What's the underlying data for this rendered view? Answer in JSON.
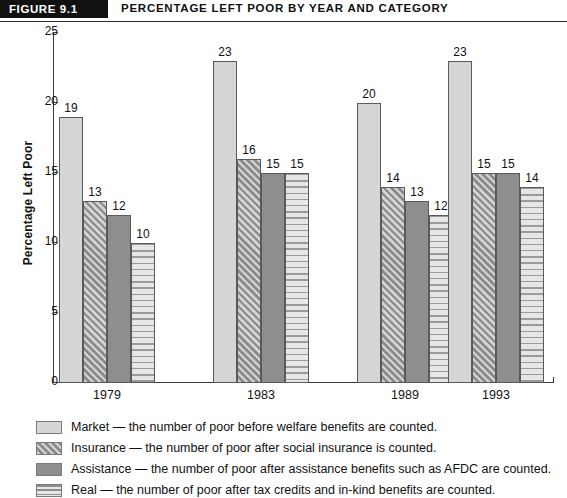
{
  "header": {
    "figure_tag": "FIGURE 9.1",
    "title": "PERCENTAGE LEFT POOR BY YEAR AND CATEGORY"
  },
  "chart_data": {
    "type": "bar",
    "title": "PERCENTAGE LEFT POOR BY YEAR AND CATEGORY",
    "xlabel": "",
    "ylabel": "Percentage Left Poor",
    "ylim": [
      0,
      25
    ],
    "yticks": [
      0,
      5,
      10,
      15,
      20,
      25
    ],
    "grid": false,
    "legend_position": "below",
    "categories": [
      "1979",
      "1983",
      "1989",
      "1993"
    ],
    "series": [
      {
        "name": "Market",
        "pattern": "solid-light-gray",
        "color": "#d6d6d6",
        "values": [
          19,
          23,
          20,
          23
        ]
      },
      {
        "name": "Insurance",
        "pattern": "diagonal-hatch",
        "color": "#d2d2d2",
        "values": [
          13,
          16,
          14,
          15
        ]
      },
      {
        "name": "Assistance",
        "pattern": "solid-dark-gray",
        "color": "#8e8e8e",
        "values": [
          12,
          15,
          13,
          15
        ]
      },
      {
        "name": "Real",
        "pattern": "horizontal-lines",
        "color": "#e2e2e2",
        "values": [
          10,
          15,
          12,
          14
        ]
      }
    ]
  },
  "legend": {
    "items": [
      {
        "key": "market",
        "text": "Market — the number of poor before welfare benefits are counted."
      },
      {
        "key": "insurance",
        "text": "Insurance — the number of poor after social insurance is counted."
      },
      {
        "key": "assistance",
        "text": "Assistance — the number of poor after assistance benefits such as AFDC are counted."
      },
      {
        "key": "real",
        "text": "Real — the number of poor after tax credits and in-kind benefits are counted."
      }
    ]
  },
  "colors": {
    "light_gray": "#d6d6d6",
    "dark_gray": "#8e8e8e",
    "banner_black": "#111111",
    "axis": "#3a3a3a"
  }
}
